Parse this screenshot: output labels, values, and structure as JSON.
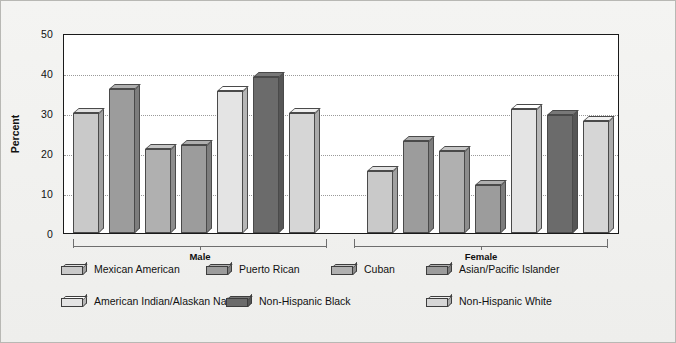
{
  "chart_data": {
    "type": "bar",
    "title": "",
    "xlabel": "",
    "ylabel": "Percent",
    "ylim": [
      0,
      50
    ],
    "yticks": [
      0,
      10,
      20,
      30,
      40,
      50
    ],
    "grid": true,
    "legend_position": "bottom",
    "groups": [
      "Male",
      "Female"
    ],
    "categories": [
      "Mexican American",
      "Puerto Rican",
      "Cuban",
      "Asian/Pacific Islander",
      "American Indian/Alaskan Native",
      "Non-Hispanic Black",
      "Non-Hispanic White"
    ],
    "series": [
      {
        "name": "Male",
        "values": [
          30.0,
          36.0,
          21.0,
          22.0,
          35.5,
          39.0,
          30.0
        ]
      },
      {
        "name": "Female",
        "values": [
          15.5,
          23.0,
          20.5,
          12.0,
          31.0,
          29.5,
          28.0
        ]
      }
    ],
    "colors": [
      "#c9c9c9",
      "#9c9c9c",
      "#b0b0b0",
      "#9c9c9c",
      "#e4e4e4",
      "#6b6b6b",
      "#d6d6d6"
    ]
  },
  "axis": {
    "y_label": "Percent",
    "tick_50": "50",
    "tick_40": "40",
    "tick_30": "30",
    "tick_20": "20",
    "tick_10": "10",
    "tick_0": "0"
  },
  "groups": {
    "male_label": "Male",
    "female_label": "Female"
  },
  "legend": {
    "row1": [
      {
        "label": "Mexican American"
      },
      {
        "label": "Puerto Rican"
      },
      {
        "label": "Cuban"
      },
      {
        "label": "Asian/Pacific Islander"
      }
    ],
    "row2": [
      {
        "label": "American Indian/Alaskan Native"
      },
      {
        "label": "Non-Hispanic Black"
      },
      {
        "label": "Non-Hispanic White"
      }
    ]
  }
}
